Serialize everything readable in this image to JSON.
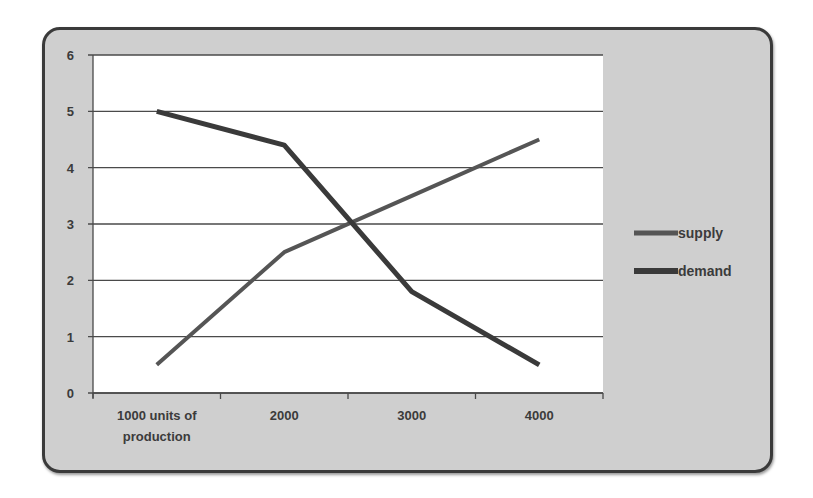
{
  "chart_data": {
    "type": "line",
    "title": "",
    "xlabel": "",
    "ylabel": "",
    "categories": [
      "1000 units of production",
      "2000",
      "3000",
      "4000"
    ],
    "category_lines": [
      [
        "1000 units of",
        "production"
      ],
      [
        "2000"
      ],
      [
        "3000"
      ],
      [
        "4000"
      ]
    ],
    "y_ticks": [
      "0",
      "1",
      "2",
      "3",
      "4",
      "5",
      "6"
    ],
    "ylim": [
      0,
      6
    ],
    "grid": true,
    "legend_position": "right",
    "series": [
      {
        "name": "supply",
        "values": [
          0.5,
          2.5,
          3.5,
          4.5
        ],
        "color": "#555555",
        "width": 4
      },
      {
        "name": "demand",
        "values": [
          5.0,
          4.4,
          1.8,
          0.5
        ],
        "color": "#3a3a3a",
        "width": 5
      }
    ]
  }
}
